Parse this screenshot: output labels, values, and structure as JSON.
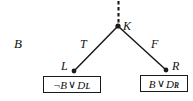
{
  "figure": {
    "type": "binary-decision-tree-fragment",
    "width": 193,
    "height": 101,
    "background_color": "#ffffff",
    "ink_color": "#1a1a1a"
  },
  "side_label": {
    "text": "B"
  },
  "nodes": [
    {
      "id": "K",
      "label": "K",
      "x": 118,
      "y": 26,
      "kind": "branch-node"
    },
    {
      "id": "L",
      "label": "L",
      "x": 74,
      "y": 71,
      "kind": "leaf-node"
    },
    {
      "id": "R",
      "label": "R",
      "x": 166,
      "y": 70,
      "kind": "leaf-node"
    }
  ],
  "edges": [
    {
      "id": "edge-true",
      "from": "K",
      "to": "L",
      "label": "T",
      "style": "solid"
    },
    {
      "id": "edge-false",
      "from": "K",
      "to": "R",
      "label": "F",
      "style": "solid"
    },
    {
      "id": "edge-parent",
      "from": "above",
      "to": "K",
      "label": "",
      "style": "dashed"
    }
  ],
  "clause_boxes": [
    {
      "id": "clause-left",
      "attached_to": "L",
      "negation": "¬",
      "literal": "B",
      "operator": "∨",
      "disjunct": "D",
      "subscript": "L",
      "text": "¬B ∨ D_L"
    },
    {
      "id": "clause-right",
      "attached_to": "R",
      "negation": "",
      "literal": "B",
      "operator": "∨",
      "disjunct": "D",
      "subscript": "R",
      "text": "B ∨ D_R"
    }
  ]
}
